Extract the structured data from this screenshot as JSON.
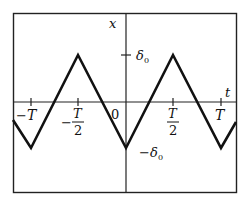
{
  "diagram": {
    "title": "",
    "type": "triangular-wave",
    "axes": {
      "x_label": "t",
      "y_label": "x",
      "origin_label": "0"
    },
    "y_ticks": [
      {
        "label": "δ₀",
        "sign": "",
        "symbol": "δ",
        "sub": "0",
        "value": 1
      },
      {
        "label": "− δ₀",
        "sign": "−",
        "symbol": "δ",
        "sub": "0",
        "value": -1
      }
    ],
    "x_ticks": [
      {
        "label": "−T",
        "sign": "−",
        "num": "T",
        "den": "",
        "value": -1
      },
      {
        "label": "−T/2",
        "sign": "−",
        "num": "T",
        "den": "2",
        "value": -0.5
      },
      {
        "label": "T/2",
        "sign": "",
        "num": "T",
        "den": "2",
        "value": 0.5
      },
      {
        "label": "T",
        "sign": "",
        "num": "T",
        "den": "",
        "value": 1
      }
    ],
    "colors": {
      "line": "#111111",
      "frame": "#222222",
      "background": "#ffffff"
    }
  }
}
